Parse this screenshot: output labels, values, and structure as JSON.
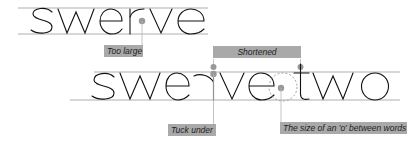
{
  "diagram": {
    "top_word": "swerve",
    "bottom_word_1": "swerve",
    "bottom_word_2": "two",
    "annotations": {
      "too_large": "Too large",
      "shortened": "Shortened",
      "tuck_under": "Tuck under",
      "o_spacing": "The size of an 'o' between words"
    },
    "colors": {
      "guide_line": "#888888",
      "dot": "#999999",
      "leader": "#b0b0b0",
      "label_bg": "#a9a9a9",
      "letter_stroke": "#111111"
    }
  }
}
